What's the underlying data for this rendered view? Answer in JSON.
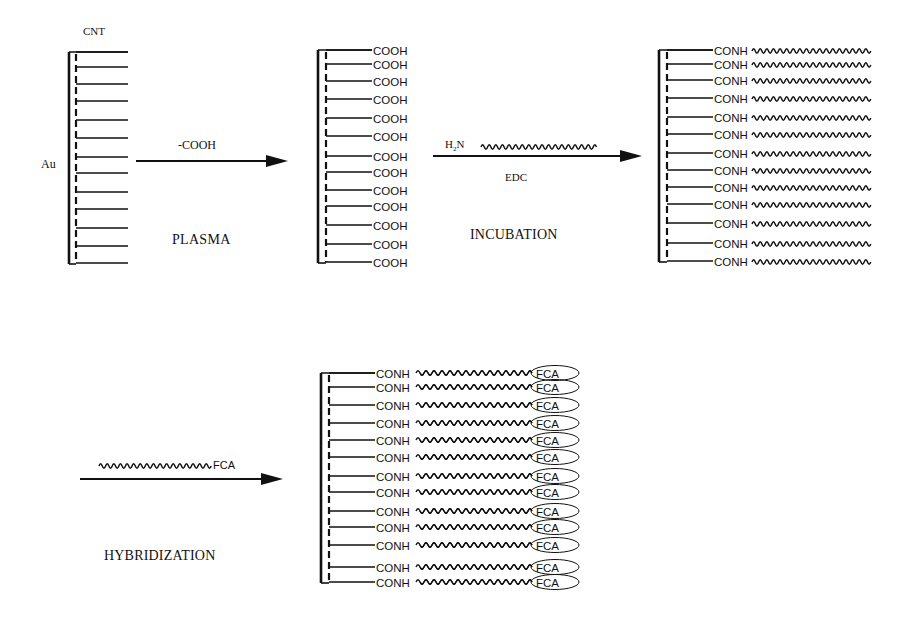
{
  "colors": {
    "ink": "#111111",
    "background": "#ffffff"
  },
  "labels": {
    "cnt": "CNT",
    "au": "Au",
    "step1_reagent": "-COOH",
    "step1_name": "PLASMA",
    "step2_reagent_prefix": "H",
    "step2_reagent_sub": "2",
    "step2_reagent_suffix": "N",
    "step2_catalyst": "EDC",
    "step2_name": "INCUBATION",
    "step3_reagent_tail": "FCA",
    "step3_name": "HYBRIDIZATION"
  },
  "panels": [
    {
      "id": "bare-cnt-electrode",
      "bar_x": 69,
      "dash_x": 76,
      "line_end": 128,
      "group_label": "",
      "rows_y": [
        52,
        67,
        84,
        101,
        120,
        138,
        157,
        173,
        192,
        209,
        228,
        246,
        263
      ],
      "row_label": "",
      "tail": "none"
    },
    {
      "id": "carboxylated-cnt-electrode",
      "bar_x": 318,
      "dash_x": 326,
      "line_end": 372,
      "rows_y": [
        50,
        64,
        81,
        99,
        118,
        136,
        156,
        172,
        190,
        206,
        225,
        244,
        262
      ],
      "row_label": "COOH",
      "tail": "none"
    },
    {
      "id": "probe-immobilized-electrode",
      "bar_x": 659,
      "dash_x": 667,
      "line_end": 713,
      "rows_y": [
        50,
        64,
        80,
        98,
        117,
        134,
        153,
        170,
        187,
        204,
        223,
        243,
        261
      ],
      "row_label": "CONH",
      "tail": "wave"
    },
    {
      "id": "hybridized-electrode",
      "bar_x": 321,
      "dash_x": 329,
      "line_end": 375,
      "rows_y": [
        373,
        387,
        405,
        423,
        440,
        457,
        476,
        492,
        511,
        527,
        545,
        567,
        582
      ],
      "row_label": "CONH",
      "tail": "helix",
      "tail_end_label": "FCA"
    }
  ],
  "arrows": [
    {
      "id": "arrow-plasma",
      "x1": 136,
      "x2": 288,
      "y": 161
    },
    {
      "id": "arrow-incubation",
      "x1": 433,
      "x2": 642,
      "y": 156
    },
    {
      "id": "arrow-hybridization",
      "x1": 80,
      "x2": 283,
      "y": 479
    }
  ]
}
